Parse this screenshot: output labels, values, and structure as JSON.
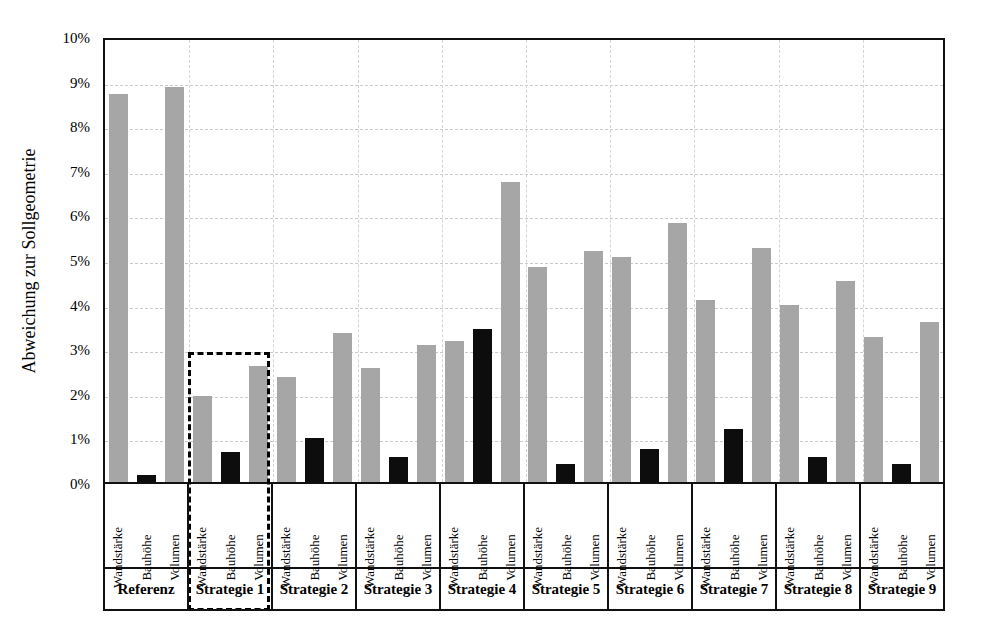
{
  "chart_data": {
    "type": "bar",
    "title": "",
    "xlabel": "",
    "ylabel": "Abweichung  zur Sollgeometrie",
    "ylim": [
      0,
      10
    ],
    "yunit": "%",
    "ytick_labels": [
      "0%",
      "1%",
      "2%",
      "3%",
      "4%",
      "5%",
      "6%",
      "7%",
      "8%",
      "9%",
      "10%"
    ],
    "ytick_values": [
      0,
      1,
      2,
      3,
      4,
      5,
      6,
      7,
      8,
      9,
      10
    ],
    "grid": "horizontal-and-vertical-dashed",
    "legend": "none",
    "categories": [
      "Referenz",
      "Strategie 1",
      "Strategie 2",
      "Strategie 3",
      "Strategie 4",
      "Strategie 5",
      "Strategie 6",
      "Strategie 7",
      "Strategie 8",
      "Strategie 9"
    ],
    "subcategories": [
      "Wandstärke",
      "Bauhöhe",
      "Volumen"
    ],
    "series": [
      {
        "name": "Wandstärke",
        "color": "#a6a6a6",
        "values": [
          8.7,
          1.92,
          2.35,
          2.55,
          3.17,
          4.83,
          5.05,
          4.08,
          3.97,
          3.25
        ]
      },
      {
        "name": "Bauhöhe",
        "color": "#0d0d0d",
        "values": [
          0.15,
          0.67,
          0.98,
          0.55,
          3.43,
          0.4,
          0.75,
          1.18,
          0.55,
          0.4
        ]
      },
      {
        "name": "Volumen",
        "color": "#a6a6a6",
        "values": [
          8.85,
          2.6,
          3.35,
          3.08,
          6.72,
          5.17,
          5.8,
          5.25,
          4.5,
          3.58
        ]
      }
    ],
    "annotations": [
      {
        "type": "dashed-highlight-box",
        "target_category": "Strategie 1",
        "stroke": "#000000",
        "style": "dashed"
      }
    ]
  },
  "axis": {
    "y_title": "Abweichung  zur Sollgeometrie"
  },
  "colors": {
    "bar_light": "#a6a6a6",
    "bar_dark": "#0d0d0d",
    "frame": "#111111",
    "grid": "#c9c9c9",
    "background": "#ffffff"
  }
}
